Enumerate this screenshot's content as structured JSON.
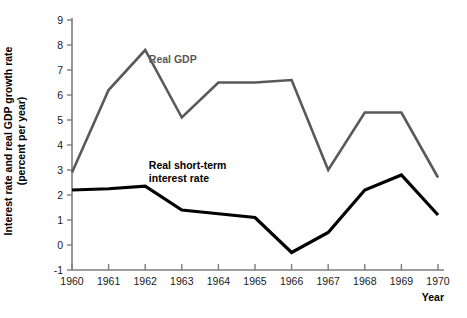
{
  "chart_data": {
    "type": "line",
    "title": "",
    "subtitle": "",
    "xlabel": "Year",
    "ylabel_line1": "Interest rate and real GDP growth rate",
    "ylabel_line2": "(percent per year)",
    "categories": [
      "1960",
      "1961",
      "1962",
      "1963",
      "1964",
      "1965",
      "1966",
      "1967",
      "1968",
      "1969",
      "1970"
    ],
    "x": [
      1960,
      1961,
      1962,
      1963,
      1964,
      1965,
      1966,
      1967,
      1968,
      1969,
      1970
    ],
    "xlim": [
      1960,
      1970
    ],
    "ylim": [
      -1,
      9
    ],
    "yticks": [
      "-1",
      "0",
      "1",
      "2",
      "3",
      "4",
      "5",
      "6",
      "7",
      "8",
      "9"
    ],
    "ytick_values": [
      -1,
      0,
      1,
      2,
      3,
      4,
      5,
      6,
      7,
      8,
      9
    ],
    "grid": false,
    "legend_position": "inline-annotation",
    "series": [
      {
        "name": "Real GDP",
        "color": "#595959",
        "stroke_width": 2.6,
        "values": [
          2.9,
          6.2,
          7.8,
          5.1,
          6.5,
          6.5,
          6.6,
          3.0,
          5.3,
          5.3,
          2.7
        ],
        "label_x": 1962.1,
        "label_y": 7.3
      },
      {
        "name": "Real short-term interest rate",
        "name_line1": "Real short-term",
        "name_line2": "interest rate",
        "color": "#000000",
        "stroke_width": 3.2,
        "values": [
          2.2,
          2.25,
          2.35,
          1.4,
          1.25,
          1.1,
          -0.3,
          0.5,
          2.2,
          2.8,
          1.2
        ],
        "label_x": 1962.1,
        "label_y": 3.05
      }
    ]
  },
  "axes": {
    "x_axis_title": "Year",
    "y_axis_title_line1": "Interest rate and real GDP growth rate",
    "y_axis_title_line2": "(percent per year)"
  },
  "colors": {
    "gdp_line": "#595959",
    "interest_line": "#000000",
    "axis": "#7d7d7d",
    "background": "#ffffff",
    "text": "#1a1a1a"
  }
}
